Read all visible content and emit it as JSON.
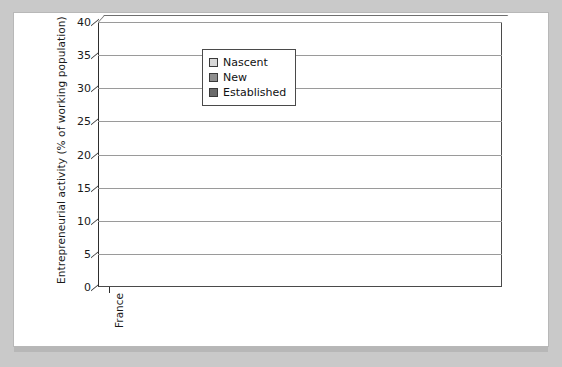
{
  "chart_data": {
    "type": "bar",
    "subtype": "stacked-3d-column",
    "title": "",
    "xlabel": "",
    "ylabel": "Entrepreneurial activity (% of working population)",
    "ylim": [
      0,
      40
    ],
    "yticks": [
      0,
      5,
      10,
      15,
      20,
      25,
      30,
      35,
      40
    ],
    "grid": "horizontal",
    "legend_position": "upper-left-inside",
    "categories": [
      "France",
      "Germany",
      "UK",
      "Italy",
      "Singapore",
      "Switzerland",
      "USA",
      "Ireland",
      "Australia",
      "Jamaica",
      "China",
      "New Zealand",
      "Thailand",
      "",
      "Average"
    ],
    "series": [
      {
        "name": "Established",
        "color": "#6b6b6b",
        "values": [
          2.2,
          4.2,
          5.0,
          6.3,
          4.8,
          9.8,
          8.0,
          8.3,
          9.0,
          8.0,
          10.5,
          11.0,
          14.0,
          null,
          6.5
        ]
      },
      {
        "name": "New",
        "color": "#8e8e8e",
        "values": [
          0.6,
          2.6,
          3.0,
          2.2,
          3.5,
          0.5,
          4.5,
          5.5,
          5.0,
          8.0,
          11.5,
          9.5,
          13.0,
          null,
          4.3
        ]
      },
      {
        "name": "Nascent",
        "color": "#d8d8d8",
        "values": [
          4.7,
          3.2,
          3.2,
          3.0,
          3.7,
          5.5,
          4.5,
          4.5,
          6.5,
          10.5,
          6.5,
          9.5,
          10.0,
          null,
          4.5
        ]
      }
    ],
    "cumulative_tops": {
      "established": [
        2.2,
        4.2,
        5.0,
        6.3,
        4.8,
        9.8,
        8.0,
        8.3,
        9.0,
        8.0,
        10.5,
        11.0,
        14.0,
        null,
        6.5
      ],
      "new": [
        2.8,
        6.8,
        8.0,
        8.5,
        8.3,
        10.3,
        12.5,
        13.8,
        14.0,
        16.0,
        22.0,
        20.5,
        27.0,
        null,
        10.8
      ],
      "total": [
        7.5,
        10.0,
        11.2,
        11.5,
        12.0,
        15.8,
        17.0,
        18.3,
        20.5,
        26.5,
        28.5,
        30.0,
        37.0,
        null,
        15.3
      ]
    }
  },
  "legend": {
    "items": [
      {
        "label": "Nascent",
        "key": "nascent"
      },
      {
        "label": "New",
        "key": "new"
      },
      {
        "label": "Established",
        "key": "established"
      }
    ]
  }
}
